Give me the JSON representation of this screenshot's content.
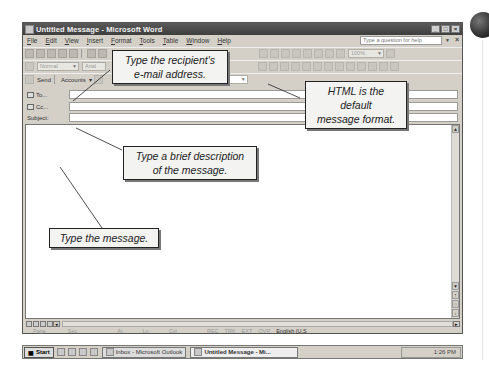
{
  "window": {
    "title": "Untitled Message - Microsoft Word",
    "controls": [
      "_",
      "□",
      "×"
    ]
  },
  "menubar": {
    "items": [
      "File",
      "Edit",
      "View",
      "Insert",
      "Format",
      "Tools",
      "Table",
      "Window",
      "Help"
    ],
    "help_placeholder": "Type a question for help"
  },
  "toolbar": {
    "zoom": "100%",
    "style": "Normal",
    "font": "Arial",
    "send_label": "Send",
    "accounts_label": "Accounts",
    "format_value": "HTML"
  },
  "address": {
    "to_label": "To...",
    "cc_label": "Cc...",
    "subject_label": "Subject:",
    "to_value": "",
    "cc_value": "",
    "subject_value": ""
  },
  "statusbar": {
    "items": [
      "Page",
      "Sec",
      "At",
      "Ln",
      "Col",
      "REC",
      "TRK",
      "EXT",
      "OVR"
    ],
    "language": "English (U.S"
  },
  "taskbar": {
    "start_label": "Start",
    "tasks": [
      "Inbox - Microsoft Outlook",
      "Untitled Message - Mi..."
    ],
    "clock": "1:26 PM"
  },
  "callouts": {
    "recipient": [
      "Type the recipient's",
      "e-mail address."
    ],
    "html": [
      "HTML is the default",
      "message format."
    ],
    "subject": [
      "Type a brief description",
      "of the message."
    ],
    "message": [
      "Type the message."
    ]
  }
}
